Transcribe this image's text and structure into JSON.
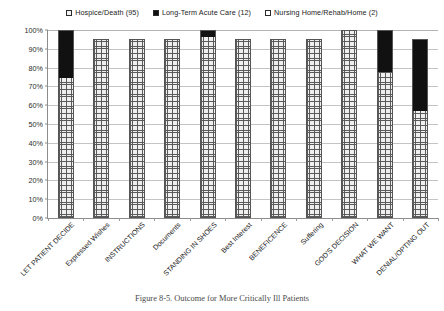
{
  "caption": "Figure 8-5. Outcome for More Critically Ill Patients",
  "legend": {
    "items": [
      {
        "label": "Hospice/Death (95)",
        "swatch": "hatched-square-icon",
        "color": "#f2f2f2"
      },
      {
        "label": "Long-Term Acute Care (12)",
        "swatch": "filled-black-square-icon",
        "color": "#111111"
      },
      {
        "label": "Nursing Home/Rehab/Home (2)",
        "swatch": "empty-square-icon",
        "color": "#ffffff"
      }
    ]
  },
  "chart_data": {
    "type": "bar",
    "stacked": true,
    "title": "",
    "subtitle": "",
    "xlabel": "",
    "ylabel": "",
    "ylim": [
      0,
      100
    ],
    "ytick_labels": [
      "0%",
      "10%",
      "20%",
      "30%",
      "40%",
      "50%",
      "60%",
      "70%",
      "80%",
      "90%",
      "100%"
    ],
    "ytick_values": [
      0,
      10,
      20,
      30,
      40,
      50,
      60,
      70,
      80,
      90,
      100
    ],
    "grid": true,
    "legend_position": "top-center",
    "categories": [
      "LET PATIENT DECIDE",
      "Expressed Wishes",
      "INSTRUCTIONS",
      "Documents",
      "STANDING IN SHOES",
      "Best Interest",
      "BENEFICENCE",
      "Suffering",
      "GOD'S DECISION",
      "WHAT WE WANT",
      "DENIAL/OPTING OUT"
    ],
    "series": [
      {
        "name": "Hospice/Death (95)",
        "fill": "hatched",
        "color": "#f2f2f2",
        "values": [
          75,
          95,
          95,
          95,
          97,
          95,
          95,
          95,
          100,
          78,
          57
        ]
      },
      {
        "name": "Long-Term Acute Care (12)",
        "fill": "solid-black",
        "color": "#111111",
        "values": [
          25,
          0,
          0,
          0,
          3,
          0,
          0,
          0,
          0,
          22,
          38
        ]
      },
      {
        "name": "Nursing Home/Rehab/Home (2)",
        "fill": "white",
        "color": "#ffffff",
        "values": [
          0,
          0,
          0,
          0,
          0,
          0,
          0,
          0,
          0,
          0,
          0
        ]
      }
    ],
    "bar_tops": [
      100,
      95,
      95,
      95,
      100,
      95,
      95,
      95,
      100,
      100,
      95
    ]
  }
}
